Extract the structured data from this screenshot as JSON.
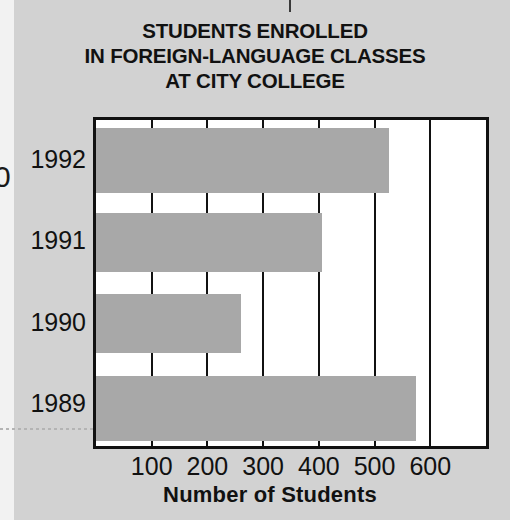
{
  "chart_data": {
    "type": "bar",
    "orientation": "horizontal",
    "title": "STUDENTS ENROLLED IN FOREIGN-LANGUAGE CLASSES AT CITY COLLEGE",
    "title_lines": [
      "STUDENTS ENROLLED",
      "IN FOREIGN-LANGUAGE CLASSES",
      "AT CITY COLLEGE"
    ],
    "categories": [
      "1992",
      "1991",
      "1990",
      "1989"
    ],
    "values": [
      525,
      405,
      260,
      575
    ],
    "xlabel": "Number of Students",
    "ylabel": "",
    "xlim": [
      0,
      700
    ],
    "xticks": [
      100,
      200,
      300,
      400,
      500,
      600
    ],
    "xtick_labels": [
      "100",
      "200",
      "300",
      "400",
      "500",
      "600"
    ],
    "grid": true,
    "legend": false,
    "bar_color": "#a8a8a8",
    "frame_color": "#111111",
    "plot_background": "#ffffff",
    "page_background": "#d2d2d2",
    "edge_glyph": "0"
  }
}
